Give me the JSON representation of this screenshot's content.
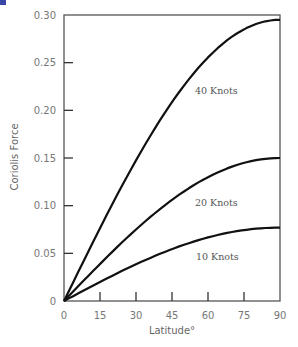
{
  "chart_data": {
    "type": "line",
    "title": "",
    "xlabel": "Latitude°",
    "ylabel": "Coriolis Force",
    "xlim": [
      0,
      90
    ],
    "ylim": [
      0,
      0.3
    ],
    "x_ticks": [
      "0",
      "15",
      "30",
      "45",
      "60",
      "75",
      "90"
    ],
    "y_ticks": [
      "0",
      "0.05",
      "0.10",
      "0.15",
      "0.20",
      "0.25",
      "0.30"
    ],
    "grid": false,
    "legend": "inline labels",
    "x": [
      0,
      15,
      30,
      45,
      60,
      75,
      90
    ],
    "series": [
      {
        "name": "40 Knots",
        "values": [
          0,
          0.077,
          0.148,
          0.209,
          0.256,
          0.285,
          0.295
        ]
      },
      {
        "name": "20 Knots",
        "values": [
          0,
          0.039,
          0.075,
          0.106,
          0.13,
          0.145,
          0.15
        ]
      },
      {
        "name": "10 Knots",
        "values": [
          0,
          0.02,
          0.039,
          0.055,
          0.067,
          0.074,
          0.077
        ]
      }
    ]
  },
  "labels": {
    "series_40": "40 Knots",
    "series_20": "20 Knots",
    "series_10": "10 Knots",
    "xlabel": "Latitude°",
    "ylabel": "Coriolis Force"
  }
}
